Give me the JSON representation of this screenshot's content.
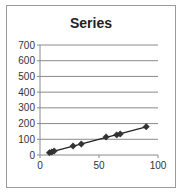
{
  "chart_data": {
    "type": "scatter",
    "title": "Series",
    "xlabel": "",
    "ylabel": "",
    "xlim": [
      0,
      100
    ],
    "ylim": [
      0,
      700
    ],
    "x_ticks": [
      0,
      50,
      100
    ],
    "y_ticks": [
      0,
      100,
      200,
      300,
      400,
      500,
      600,
      700
    ],
    "grid": "horizontal",
    "legend": "none",
    "series": [
      {
        "name": "Series",
        "marker": "diamond",
        "line": "linear trendline",
        "color": "#222222",
        "x": [
          8,
          10,
          12,
          28,
          35,
          56,
          65,
          68,
          90
        ],
        "y": [
          15,
          19,
          25,
          57,
          70,
          115,
          128,
          134,
          180
        ]
      }
    ]
  }
}
